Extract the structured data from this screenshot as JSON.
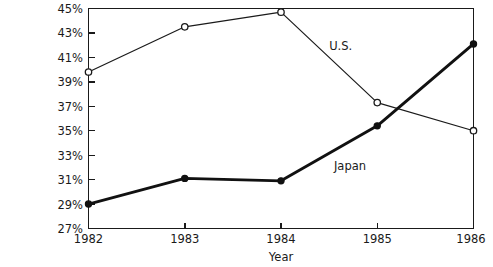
{
  "chart_data": {
    "type": "line",
    "title": "",
    "subtitle": "",
    "xlabel": "Year",
    "ylabel": "",
    "categories": [
      "1982",
      "1983",
      "1984",
      "1985",
      "1986"
    ],
    "x": [
      1982,
      1983,
      1984,
      1985,
      1986
    ],
    "xlim": [
      1982,
      1986
    ],
    "ylim": [
      27,
      45
    ],
    "y_tick_step": 2,
    "y_tick_labels": [
      "27%",
      "29%",
      "31%",
      "33%",
      "35%",
      "37%",
      "39%",
      "41%",
      "43%",
      "45%"
    ],
    "y_tick_values": [
      27,
      29,
      31,
      33,
      35,
      37,
      39,
      41,
      43,
      45
    ],
    "x_tick_labels": [
      "1982",
      "1983",
      "1984",
      "1985",
      "1986"
    ],
    "grid": false,
    "legend_position": "inline-annotation",
    "series": [
      {
        "name": "U.S.",
        "marker": "open-circle",
        "line_weight": "thin",
        "values": [
          39.8,
          43.5,
          44.7,
          37.3,
          35.0
        ]
      },
      {
        "name": "Japan",
        "marker": "filled-circle",
        "line_weight": "thick",
        "values": [
          29.0,
          31.1,
          30.9,
          35.4,
          42.1
        ]
      }
    ],
    "annotations": [
      {
        "text": "U.S.",
        "x": 1984.5,
        "y": 41.9
      },
      {
        "text": "Japan",
        "x": 1984.55,
        "y": 32.1
      }
    ],
    "colors": {
      "axis": "#1a1a1a",
      "us_line": "#1a1a1a",
      "japan_line": "#111111",
      "background": "#ffffff",
      "text": "#1a1a1a"
    }
  },
  "axis": {
    "x_title": "Year"
  },
  "labels": {
    "us": "U.S.",
    "japan": "Japan"
  },
  "yticks": {
    "t45": "45%",
    "t43": "43%",
    "t41": "41%",
    "t39": "39%",
    "t37": "37%",
    "t35": "35%",
    "t33": "33%",
    "t31": "31%",
    "t29": "29%",
    "t27": "27%"
  },
  "xticks": {
    "t1982": "1982",
    "t1983": "1983",
    "t1984": "1984",
    "t1985": "1985",
    "t1986": "1986"
  }
}
